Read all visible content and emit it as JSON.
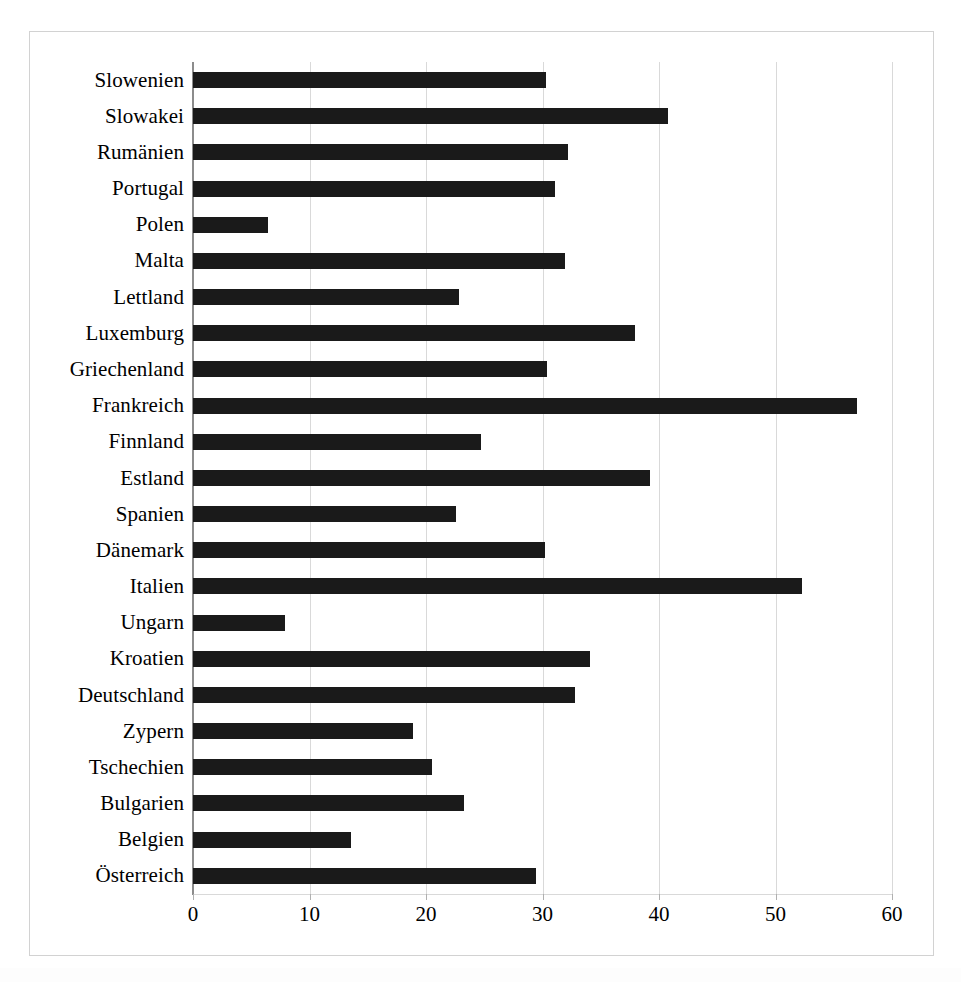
{
  "chart_data": {
    "type": "bar",
    "orientation": "horizontal",
    "title": "",
    "subtitle": "",
    "xlabel": "",
    "ylabel": "",
    "xlim": [
      0,
      60
    ],
    "xticks": [
      0,
      10,
      20,
      30,
      40,
      50,
      60
    ],
    "grid": true,
    "legend": false,
    "legend_position": "none",
    "bar_color": "#1a1a1a",
    "gridline_color": "#d9d9d9",
    "axis_color": "#8c8c8c",
    "frame_color": "#d2d2d2",
    "background_color": "#ffffff",
    "categories": [
      "Slowenien",
      "Slowakei",
      "Rumänien",
      "Portugal",
      "Polen",
      "Malta",
      "Lettland",
      "Luxemburg",
      "Griechenland",
      "Frankreich",
      "Finnland",
      "Estland",
      "Spanien",
      "Dänemark",
      "Italien",
      "Ungarn",
      "Kroatien",
      "Deutschland",
      "Zypern",
      "Tschechien",
      "Bulgarien",
      "Belgien",
      "Österreich"
    ],
    "values": [
      30.3,
      40.8,
      32.2,
      31.1,
      6.4,
      31.9,
      22.8,
      37.9,
      30.4,
      57.0,
      24.7,
      39.2,
      22.6,
      30.2,
      52.3,
      7.9,
      34.1,
      32.8,
      18.9,
      20.5,
      23.3,
      13.6,
      29.4
    ]
  }
}
